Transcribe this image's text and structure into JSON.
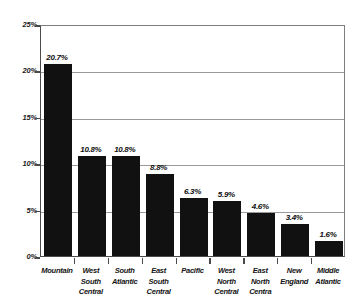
{
  "chart_data": {
    "type": "bar",
    "title": "",
    "xlabel": "",
    "ylabel": "",
    "ylim": [
      0,
      25
    ],
    "grid": true,
    "legend": false,
    "yticks": [
      "0%",
      "5%",
      "10%",
      "15%",
      "20%",
      "25%"
    ],
    "ytick_values": [
      0,
      5,
      10,
      15,
      20,
      25
    ],
    "categories": [
      "Mountain",
      "West South Central",
      "South Atlantic",
      "East South Central",
      "Pacific",
      "West North Central",
      "East North Centra",
      "New England",
      "Middle Atlantic"
    ],
    "category_lines": [
      [
        "Mountain"
      ],
      [
        "West",
        "South",
        "Central"
      ],
      [
        "South",
        "Atlantic"
      ],
      [
        "East South",
        "Central"
      ],
      [
        "Pacific"
      ],
      [
        "West",
        "North",
        "Central"
      ],
      [
        "East North",
        "Centra"
      ],
      [
        "New",
        "England"
      ],
      [
        "Middle",
        "Atlantic"
      ]
    ],
    "values": [
      20.7,
      10.8,
      10.8,
      8.8,
      6.3,
      5.9,
      4.6,
      3.4,
      1.6
    ],
    "data_labels": [
      "20.7%",
      "10.8%",
      "10.8%",
      "8.8%",
      "6.3%",
      "5.9%",
      "4.6%",
      "3.4%",
      "1.6%"
    ],
    "colors": {
      "bar": "#111111",
      "gridline": "#9a9a9a",
      "axis": "#4a4a4a",
      "text": "#131313",
      "background": "#ffffff"
    }
  }
}
